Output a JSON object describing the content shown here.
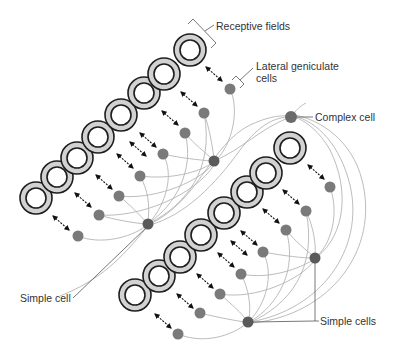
{
  "diagram": {
    "labels": {
      "receptive_fields": "Receptive fields",
      "lgn_line1": "Lateral geniculate",
      "lgn_line2": "cells",
      "complex_cell": "Complex cell",
      "simple_cell": "Simple cell",
      "simple_cells": "Simple cells"
    },
    "colors": {
      "ring_fill": "#d2d2d2",
      "ring_stroke": "#1e1e1e",
      "lgn_dot": "#7a7a7a",
      "simple_dot": "#5a5a5a",
      "connection": "#b4b4b4",
      "text": "#333333"
    },
    "groups": [
      {
        "name": "upper-group",
        "receptive_fields": [
          [
            190,
            50
          ],
          [
            164,
            74
          ],
          [
            144,
            93
          ],
          [
            121,
            115
          ],
          [
            98,
            137
          ],
          [
            77,
            158
          ],
          [
            57,
            177
          ],
          [
            36,
            198
          ]
        ],
        "lgn_cells": [
          [
            230,
            89
          ],
          [
            204,
            113
          ],
          [
            185,
            133
          ],
          [
            163,
            154
          ],
          [
            140,
            176
          ],
          [
            119,
            196
          ],
          [
            99,
            215
          ],
          [
            78,
            236
          ]
        ],
        "simple_cells": [
          [
            214,
            161
          ],
          [
            148,
            224
          ]
        ]
      },
      {
        "name": "lower-group",
        "receptive_fields": [
          [
            290,
            148
          ],
          [
            266,
            173
          ],
          [
            247,
            192
          ],
          [
            224,
            213
          ],
          [
            201,
            235
          ],
          [
            180,
            257
          ],
          [
            159,
            276
          ],
          [
            135,
            295
          ]
        ],
        "lgn_cells": [
          [
            330,
            187
          ],
          [
            306,
            211
          ],
          [
            286,
            230
          ],
          [
            263,
            252
          ],
          [
            241,
            274
          ],
          [
            220,
            294
          ],
          [
            200,
            313
          ],
          [
            178,
            334
          ]
        ],
        "simple_cells": [
          [
            315,
            258
          ],
          [
            248,
            322
          ]
        ]
      }
    ],
    "complex_cell": [
      291,
      117
    ]
  }
}
